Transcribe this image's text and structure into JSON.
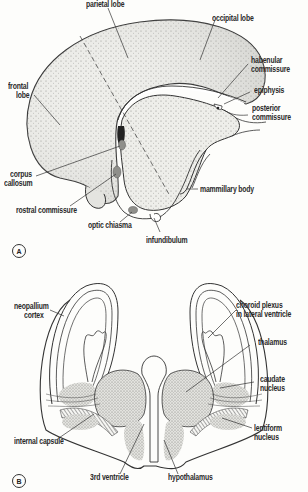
{
  "figure_a": {
    "panel_label": "A",
    "labels": {
      "parietal_lobe": "parietal lobe",
      "occipital_lobe": "occipital lobe",
      "frontal_lobe_1": "frontal",
      "frontal_lobe_2": "lobe",
      "habenular_1": "habenular",
      "habenular_2": "commissure",
      "epiphysis": "epiphysis",
      "posterior_1": "posterior",
      "posterior_2": "commissure",
      "corpus_1": "corpus",
      "corpus_2": "callosum",
      "mammillary_body": "mammillary body",
      "rostral_commissure": "rostral commissure",
      "optic_chiasma": "optic chiasma",
      "infundibulum": "infundibulum"
    }
  },
  "figure_b": {
    "panel_label": "B",
    "labels": {
      "neopallium_1": "neopallium",
      "neopallium_2": "cortex",
      "choroid_1": "choroid plexus",
      "choroid_2": "in lateral ventricle",
      "thalamus": "thalamus",
      "caudate_1": "caudate",
      "caudate_2": "nucleus",
      "internal_capsule": "internal capsule",
      "lentiform_1": "lentiform",
      "lentiform_2": "nucleus",
      "third_ventricle": "3rd ventricle",
      "hypothalamus": "hypothalamus"
    }
  },
  "colors": {
    "background": "#fdfdfb",
    "ink": "#2a2a2a",
    "brain_fill": "#e9e9e6",
    "stipple": "#8a8a86",
    "dark_shade": "#6e6e6a"
  }
}
